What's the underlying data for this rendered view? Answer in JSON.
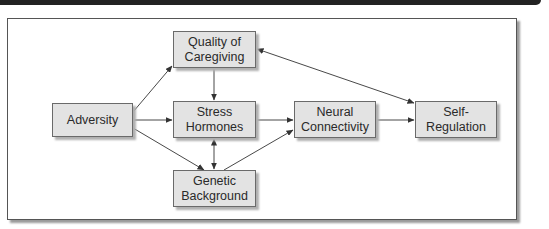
{
  "diagram": {
    "nodes": [
      {
        "id": "adversity",
        "label": "Adversity"
      },
      {
        "id": "quality",
        "label": "Quality of\nCaregiving"
      },
      {
        "id": "stress",
        "label": "Stress\nHormones"
      },
      {
        "id": "genetic",
        "label": "Genetic\nBackground"
      },
      {
        "id": "neural",
        "label": "Neural\nConnectivity"
      },
      {
        "id": "selfreg",
        "label": "Self-\nRegulation"
      }
    ],
    "edges": [
      {
        "from": "adversity",
        "to": "quality",
        "direction": "forward"
      },
      {
        "from": "adversity",
        "to": "stress",
        "direction": "forward"
      },
      {
        "from": "adversity",
        "to": "genetic",
        "direction": "forward"
      },
      {
        "from": "quality",
        "to": "stress",
        "direction": "forward"
      },
      {
        "from": "stress",
        "to": "genetic",
        "direction": "bidirectional"
      },
      {
        "from": "stress",
        "to": "neural",
        "direction": "forward"
      },
      {
        "from": "genetic",
        "to": "neural",
        "direction": "forward"
      },
      {
        "from": "neural",
        "to": "selfreg",
        "direction": "forward"
      },
      {
        "from": "quality",
        "to": "selfreg",
        "direction": "bidirectional"
      }
    ]
  },
  "colors": {
    "header_bar": "#222222",
    "node_fill": "#e3e3e3",
    "node_border": "#6a6a6a",
    "edge": "#333333"
  }
}
